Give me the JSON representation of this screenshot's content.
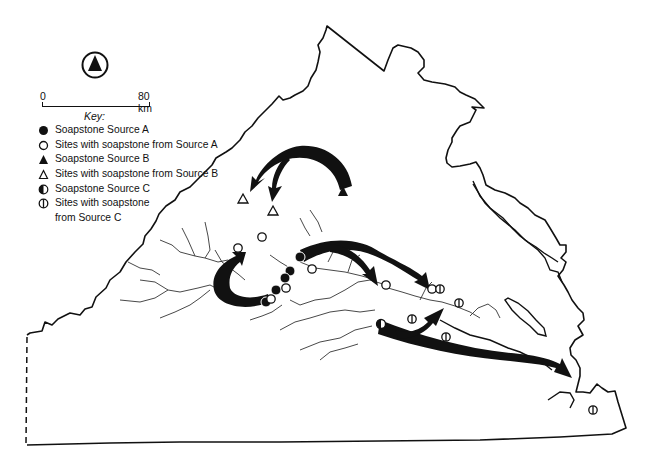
{
  "map": {
    "north_arrow": "north-arrow-icon",
    "scale": {
      "start_label": "0",
      "end_label": "80 km"
    },
    "key": {
      "title": "Key:",
      "items": [
        {
          "symbol": "filled-circle",
          "label": "Soapstone Source A"
        },
        {
          "symbol": "open-circle",
          "label": "Sites with soapstone from Source A"
        },
        {
          "symbol": "filled-triangle",
          "label": "Soapstone Source B"
        },
        {
          "symbol": "open-triangle",
          "label": "Sites with soapstone from Source B"
        },
        {
          "symbol": "half-filled-circle",
          "label": "Soapstone Source C"
        },
        {
          "symbol": "barred-circle",
          "label": "Sites with soapstone",
          "label_cont": "from Source C"
        }
      ]
    },
    "colors": {
      "ink": "#111111",
      "river": "#333333",
      "background": "#ffffff"
    },
    "features": {
      "source_a_points": [
        [
          276,
          290
        ],
        [
          290,
          271
        ],
        [
          300,
          257
        ],
        [
          266,
          302
        ]
      ],
      "source_a_sites": [
        [
          238,
          248
        ],
        [
          262,
          237
        ],
        [
          312,
          269
        ],
        [
          286,
          288
        ],
        [
          271,
          298
        ],
        [
          386,
          285
        ],
        [
          432,
          289
        ]
      ],
      "source_b_points": [
        [
          343,
          191
        ]
      ],
      "source_b_sites": [
        [
          243,
          199
        ],
        [
          273,
          210
        ]
      ],
      "source_c_points": [
        [
          381,
          324
        ]
      ],
      "source_c_sites": [
        [
          440,
          289
        ],
        [
          459,
          303
        ],
        [
          412,
          319
        ],
        [
          446,
          337
        ],
        [
          593,
          410
        ]
      ]
    }
  }
}
